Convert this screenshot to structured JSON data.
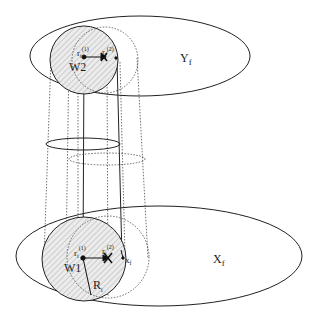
{
  "diagram": {
    "type": "cylinder-projection-schematic",
    "top_plane": {
      "label": "Y",
      "label_sub": "f",
      "ellipse": {
        "cx": 140,
        "cy": 56,
        "rx": 110,
        "ry": 40
      }
    },
    "bottom_plane": {
      "label": "X",
      "label_sub": "f",
      "ellipse": {
        "cx": 159,
        "cy": 256,
        "rx": 143,
        "ry": 50
      }
    },
    "top_circles": {
      "solid": {
        "label": "W2",
        "cx": 84,
        "cy": 60,
        "r": 34
      },
      "dotted": {
        "cx": 105,
        "cy": 60,
        "r": 33
      }
    },
    "bottom_circles": {
      "solid": {
        "label": "W1",
        "cx": 84,
        "cy": 259,
        "r": 42
      },
      "dotted": {
        "cx": 108,
        "cy": 257,
        "r": 41
      }
    },
    "points": {
      "r1": {
        "label": "r",
        "sub": "i",
        "sup": "(1)"
      },
      "r2": {
        "label": "r",
        "sub": "i",
        "sup": "(2)"
      },
      "xf": {
        "label": "x",
        "sub": "f"
      },
      "Ri": {
        "label": "R",
        "sub": "i"
      }
    },
    "middle_ellipses": [
      {
        "style": "solid",
        "cx": 83,
        "cy": 144,
        "rx": 37,
        "ry": 6
      },
      {
        "style": "dotted",
        "cx": 107,
        "cy": 159,
        "rx": 38,
        "ry": 6
      }
    ],
    "colors": {
      "stroke": "#222222",
      "hatch": "#9a9a9a",
      "fill": "#e6e6e6"
    }
  }
}
